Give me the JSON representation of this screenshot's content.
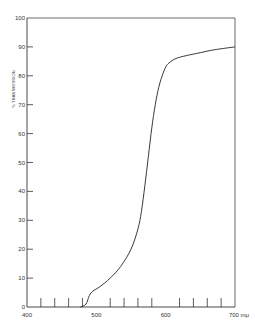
{
  "chart_data": {
    "type": "line",
    "title": "",
    "xlabel": "mμ",
    "ylabel": "% TRANSMISSION",
    "xlim": [
      400,
      700
    ],
    "ylim": [
      0,
      100
    ],
    "grid": false,
    "legend": null,
    "x_tick_labels": [
      "400",
      "500",
      "600",
      "700 mμ"
    ],
    "x_minor_ticks": [
      420,
      440,
      460,
      480,
      520,
      540,
      560,
      580,
      620,
      640,
      660,
      680
    ],
    "y_tick_labels": [
      "0",
      "10",
      "20",
      "30",
      "40",
      "50",
      "60",
      "70",
      "80",
      "90",
      "100"
    ],
    "series": [
      {
        "name": "transmission",
        "x": [
          477,
          485,
          490,
          495,
          505,
          520,
          535,
          550,
          560,
          565,
          570,
          575,
          580,
          585,
          590,
          595,
          600,
          605,
          615,
          630,
          650,
          670,
          700
        ],
        "y": [
          0,
          1,
          4,
          5.5,
          7,
          10,
          14,
          20,
          27,
          33,
          42,
          52,
          62,
          70,
          76,
          80,
          83,
          84.5,
          86,
          87,
          88,
          89,
          90
        ]
      }
    ]
  }
}
